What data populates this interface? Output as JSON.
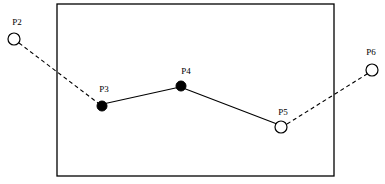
{
  "diagram": {
    "type": "point-sequence-with-region",
    "width": 385,
    "height": 184,
    "background_color": "#ffffff",
    "stroke_color": "#000000",
    "region": {
      "name": "boundary-rectangle",
      "x": 57,
      "y": 4,
      "width": 277,
      "height": 172,
      "stroke_color": "#000000",
      "fill": "none"
    },
    "nodes": [
      {
        "id": "P2",
        "label": "P2",
        "cx": 14,
        "cy": 39,
        "r": 6,
        "style": "open",
        "inside_region": false,
        "label_x": 17,
        "label_y": 25
      },
      {
        "id": "P3",
        "label": "P3",
        "cx": 102,
        "cy": 106,
        "r": 5,
        "style": "filled",
        "inside_region": true,
        "label_x": 104,
        "label_y": 92
      },
      {
        "id": "P4",
        "label": "P4",
        "cx": 181,
        "cy": 86,
        "r": 5,
        "style": "filled",
        "inside_region": true,
        "label_x": 186,
        "label_y": 74
      },
      {
        "id": "P5",
        "label": "P5",
        "cx": 281,
        "cy": 127,
        "r": 6,
        "style": "open",
        "inside_region": true,
        "label_x": 283,
        "label_y": 115
      },
      {
        "id": "P6",
        "label": "P6",
        "cx": 372,
        "cy": 70,
        "r": 6,
        "style": "open",
        "inside_region": false,
        "label_x": 371,
        "label_y": 55
      }
    ],
    "edges": [
      {
        "id": "edge-p2-p3",
        "from": "P2",
        "to": "P3",
        "style": "dashed",
        "x1": 19,
        "y1": 43,
        "x2": 98,
        "y2": 103
      },
      {
        "id": "edge-p3-p4",
        "from": "P3",
        "to": "P4",
        "style": "solid",
        "x1": 103,
        "y1": 104,
        "x2": 180,
        "y2": 87
      },
      {
        "id": "edge-p4-p5",
        "from": "P4",
        "to": "P5",
        "style": "solid",
        "x1": 183,
        "y1": 88,
        "x2": 277,
        "y2": 124
      },
      {
        "id": "edge-p5-p6",
        "from": "P5",
        "to": "P6",
        "style": "dashed",
        "x1": 287,
        "y1": 124,
        "x2": 367,
        "y2": 74
      }
    ]
  }
}
